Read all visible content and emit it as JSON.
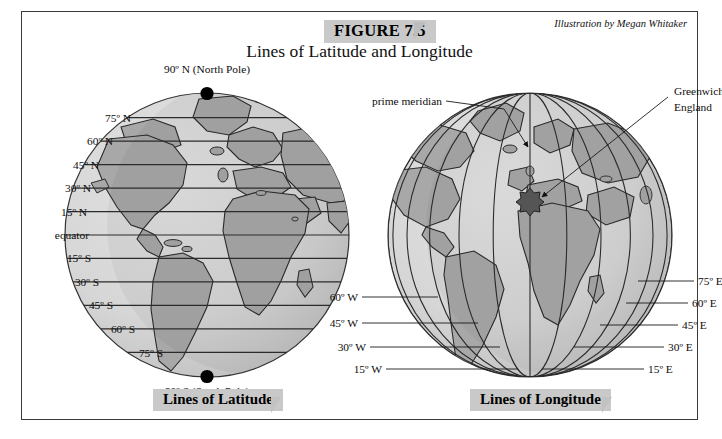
{
  "figure": {
    "badge": "FIGURE 7.5",
    "title": "Lines of Latitude and Longitude",
    "credit": "Illustration by Megan Whitaker"
  },
  "colors": {
    "ocean": "#d6d6d6",
    "ocean_shade": "#c3c3c3",
    "land": "#a8a8a8",
    "land_shade": "#9a9a9a",
    "outline": "#2b2b2b",
    "gridline": "#2b2b2b",
    "badge_bg": "#c9c9c9",
    "frame": "#3a3a3a",
    "pole_dot": "#000000"
  },
  "latitude_panel": {
    "caption": "Lines of Latitude",
    "north_pole_label": "90º N (North Pole)",
    "south_pole_label": "90º S (South Pole)",
    "labels": [
      {
        "text": "75º N",
        "value": 75
      },
      {
        "text": "60º N",
        "value": 60
      },
      {
        "text": "45º N",
        "value": 45
      },
      {
        "text": "30º N",
        "value": 30
      },
      {
        "text": "15º N",
        "value": 15
      },
      {
        "text": "equator",
        "value": 0
      },
      {
        "text": "15º S",
        "value": -15
      },
      {
        "text": "30º S",
        "value": -30
      },
      {
        "text": "45º S",
        "value": -45
      },
      {
        "text": "60º S",
        "value": -60
      },
      {
        "text": "75º S",
        "value": -75
      }
    ]
  },
  "longitude_panel": {
    "caption": "Lines of Longitude",
    "prime_meridian_label": "prime meridian",
    "greenwich_label_line1": "Greenwich,",
    "greenwich_label_line2": "England",
    "west_labels": [
      {
        "text": "60º W",
        "value": -60
      },
      {
        "text": "45º W",
        "value": -45
      },
      {
        "text": "30º W",
        "value": -30
      },
      {
        "text": "15º W",
        "value": -15
      }
    ],
    "east_labels": [
      {
        "text": "75º E",
        "value": 75
      },
      {
        "text": "60º E",
        "value": 60
      },
      {
        "text": "45º E",
        "value": 45
      },
      {
        "text": "30º E",
        "value": 30
      },
      {
        "text": "15º E",
        "value": 15
      }
    ]
  }
}
